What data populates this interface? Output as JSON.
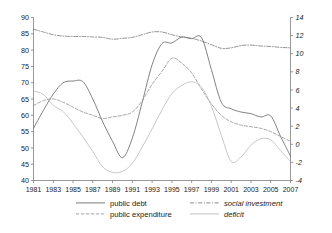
{
  "chart_data": {
    "type": "line",
    "title": "",
    "subtitle": "",
    "xlabel": "",
    "ylabel": "",
    "y2label": "",
    "grid": false,
    "legend_position": "bottom",
    "x": [
      1981,
      1982,
      1983,
      1984,
      1985,
      1986,
      1987,
      1988,
      1989,
      1990,
      1991,
      1992,
      1993,
      1994,
      1995,
      1996,
      1997,
      1998,
      1999,
      2000,
      2001,
      2002,
      2003,
      2004,
      2005,
      2006,
      2007
    ],
    "xticks": [
      1981,
      1983,
      1985,
      1987,
      1989,
      1991,
      1993,
      1995,
      1997,
      1999,
      2001,
      2003,
      2005,
      2007
    ],
    "xlim": [
      1981,
      2007
    ],
    "ylim": [
      40,
      90
    ],
    "yticks": [
      40,
      45,
      50,
      55,
      60,
      65,
      70,
      75,
      80,
      85,
      90
    ],
    "y2lim": [
      -4,
      14
    ],
    "y2ticks": [
      -4,
      -2,
      0,
      2,
      4,
      6,
      8,
      10,
      12,
      14
    ],
    "series": [
      {
        "name": "public debt",
        "axis": "left",
        "style": "solid",
        "color": "#5a5a5a",
        "italic": false,
        "values": [
          56.0,
          61.5,
          66.5,
          70.0,
          70.5,
          70.3,
          65.0,
          58.0,
          52.0,
          47.0,
          53.0,
          64.0,
          75.5,
          82.0,
          82.2,
          84.0,
          83.5,
          83.8,
          74.0,
          64.0,
          62.0,
          61.0,
          60.5,
          59.5,
          59.8,
          53.5,
          47.5
        ]
      },
      {
        "name": "public expenditure",
        "axis": "left",
        "style": "dashed",
        "color": "#8a8a8a",
        "italic": false,
        "values": [
          63.0,
          64.5,
          65.0,
          64.0,
          62.5,
          61.0,
          60.0,
          59.0,
          59.5,
          60.0,
          61.0,
          64.5,
          69.5,
          73.5,
          77.5,
          76.0,
          73.0,
          68.0,
          63.5,
          60.0,
          58.0,
          57.0,
          56.5,
          56.0,
          55.0,
          53.5,
          52.0
        ]
      },
      {
        "name": "social investment",
        "axis": "right",
        "style": "dash-dot",
        "color": "#6f6f6f",
        "italic": true,
        "values": [
          12.7,
          12.4,
          12.1,
          11.95,
          11.9,
          11.9,
          11.85,
          11.8,
          11.6,
          11.7,
          11.8,
          12.1,
          12.4,
          12.4,
          12.1,
          11.85,
          11.7,
          11.4,
          11.0,
          10.6,
          10.65,
          10.9,
          10.95,
          10.85,
          10.8,
          10.7,
          10.65
        ]
      },
      {
        "name": "deficit",
        "axis": "right",
        "style": "solid",
        "color": "#b5b5b5",
        "italic": true,
        "values": [
          5.9,
          5.5,
          4.3,
          3.6,
          2.3,
          0.8,
          -0.8,
          -2.5,
          -3.1,
          -3.0,
          -2.1,
          -0.3,
          1.7,
          3.8,
          5.6,
          6.5,
          6.9,
          6.3,
          4.2,
          1.0,
          -1.9,
          -1.4,
          -0.1,
          0.6,
          0.5,
          -0.7,
          -1.9
        ]
      }
    ]
  },
  "legend": {
    "entries": [
      {
        "label": "public debt",
        "style": "solid",
        "italic": false
      },
      {
        "label": "social investment",
        "style": "dash-dot",
        "italic": true
      },
      {
        "label": "public expenditure",
        "style": "dashed",
        "italic": false
      },
      {
        "label": "deficit",
        "style": "solid",
        "italic": true
      }
    ]
  }
}
